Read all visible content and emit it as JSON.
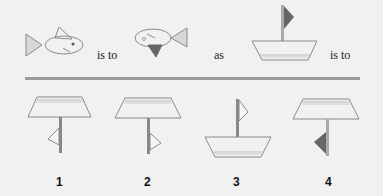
{
  "question": {
    "words": [
      "is to",
      "as",
      "is to"
    ],
    "items": [
      {
        "name": "fish-right",
        "description": "fish facing right, dorsal fin on top"
      },
      {
        "name": "fish-left-flipped",
        "description": "fish facing left, dark fin on bottom"
      },
      {
        "name": "boat-with-flag",
        "description": "boat with dark flag on mast"
      }
    ]
  },
  "options": [
    {
      "label": "1",
      "description": "upside-down boat, light flag pointing left"
    },
    {
      "label": "2",
      "description": "upside-down boat, light flag pointing right"
    },
    {
      "label": "3",
      "description": "upright boat, light flag pointing right"
    },
    {
      "label": "4",
      "description": "upside-down boat, dark flag pointing left"
    }
  ],
  "colors": {
    "background": "#f1f1f1",
    "stroke": "#8a8a8a",
    "dark_fill": "#666666",
    "divider": "#9a9a9a"
  }
}
